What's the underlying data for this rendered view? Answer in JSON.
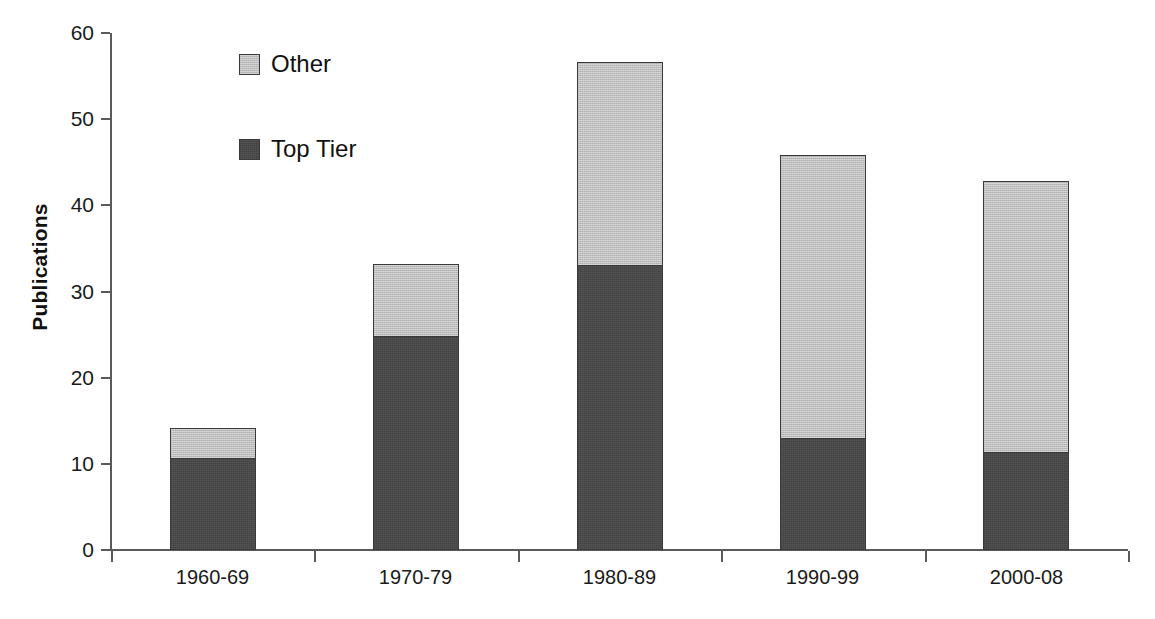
{
  "chart_data": {
    "type": "bar",
    "subtype": "stacked-vertical",
    "title": "",
    "xlabel": "",
    "ylabel": "Publications",
    "categories": [
      "1960-69",
      "1970-79",
      "1980-89",
      "1990-99",
      "2000-08"
    ],
    "series": [
      {
        "name": "Top Tier",
        "color": "#4a4a4a",
        "values": [
          10.7,
          24.8,
          33.1,
          13.0,
          11.4
        ]
      },
      {
        "name": "Other",
        "color": "#bdbdbd",
        "values": [
          3.5,
          8.4,
          23.5,
          32.8,
          31.4
        ]
      }
    ],
    "stack_order": [
      "Top Tier",
      "Other"
    ],
    "totals": [
      14.2,
      33.2,
      56.6,
      45.8,
      42.8
    ],
    "ylim": [
      0,
      60
    ],
    "yticks": [
      0,
      10,
      20,
      30,
      40,
      50,
      60
    ],
    "ytick_labels": [
      "0",
      "10",
      "20",
      "30",
      "40",
      "50",
      "60"
    ],
    "grid": false,
    "legend_position": "top-left-inside",
    "legend_entries": [
      "Other",
      "Top Tier"
    ],
    "axis_color": "#5a5a5a",
    "bar_border_color": "#3a3a3a",
    "background": "#ffffff"
  },
  "legend": {
    "items": [
      {
        "label": "Other",
        "swatch": "legend-swatch-other"
      },
      {
        "label": "Top Tier",
        "swatch": "legend-swatch-top-tier"
      }
    ]
  },
  "axes": {
    "y": {
      "label": "Publications"
    },
    "x": {
      "label": ""
    }
  }
}
